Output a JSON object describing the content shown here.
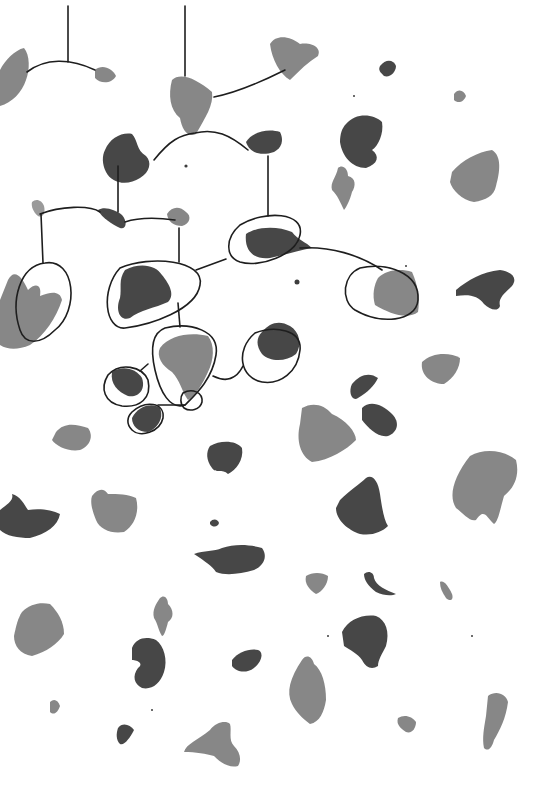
{
  "artwork": {
    "width": 551,
    "height": 789,
    "background": "#ffffff",
    "palette": {
      "dark": "#3d3d3d",
      "mid": "#7a7a7a",
      "light": "#8f8f8f",
      "wash": "#b5b5b5",
      "line": "#1e1e1e"
    },
    "wires": [
      "M68,6 L68,62",
      "M27,72 C45,58 70,58 95,70",
      "M185,6 L185,76",
      "M214,97 C240,92 265,80 285,70",
      "M154,160 C170,140 180,135 195,133 C215,128 230,135 248,150",
      "M118,166 L118,212",
      "M268,156 L268,216",
      "M40,214 C60,206 90,205 100,212",
      "M125,222 C140,217 160,218 175,220",
      "M41,214 L43,263",
      "M179,228 L179,262",
      "M178,303 L180,327",
      "M196,270 L226,259",
      "M300,248 C330,246 360,255 382,270",
      "M213,376 C225,382 236,380 243,366",
      "M140,371 L148,364",
      "M158,405 L185,405"
    ],
    "loops": [
      {
        "name": "loop-left-large",
        "d": "M45,263 C75,258 80,310 55,330 C40,345 25,345 20,330 C10,300 20,266 45,263 Z"
      },
      {
        "name": "loop-center",
        "d": "M120,268 C150,255 205,260 200,285 C196,310 150,325 125,328 C105,330 100,290 120,268 Z"
      },
      {
        "name": "loop-upper-right",
        "d": "M240,225 C265,210 305,212 300,235 C296,255 260,268 240,262 C225,257 225,238 240,225 Z"
      },
      {
        "name": "loop-right",
        "d": "M360,268 C385,262 420,272 418,300 C416,322 380,325 355,310 C340,300 343,275 360,268 Z"
      },
      {
        "name": "loop-mid-bottom",
        "d": "M165,328 C190,322 220,330 216,355 C212,380 195,395 185,405 C170,410 160,392 155,370 C150,348 152,333 165,328 Z"
      },
      {
        "name": "loop-mid-right",
        "d": "M255,333 C275,325 302,330 300,350 C298,372 280,385 262,382 C240,378 235,350 255,333 Z"
      },
      {
        "name": "loop-small-left",
        "d": "M108,375 C120,362 142,366 148,380 C152,398 140,408 122,406 C104,403 100,388 108,375 Z"
      },
      {
        "name": "loop-small-bottom",
        "d": "M132,412 C145,400 165,402 163,418 C160,432 140,438 132,430 C126,424 127,417 132,412 Z"
      },
      {
        "name": "loop-tiny-right",
        "d": "M183,393 C192,388 203,392 202,402 C200,410 190,412 184,408 C180,404 180,397 183,393 Z"
      }
    ],
    "blots": [
      {
        "name": "blot-top-left-edge",
        "tone": "mid",
        "d": "M0,70 C5,60 15,50 24,48 C30,55 30,70 26,80 C22,92 12,103 0,106 Z"
      },
      {
        "name": "blot-top-left-small",
        "tone": "mid",
        "d": "M95,70 C102,64 112,68 116,76 C112,84 100,84 95,78 Z"
      },
      {
        "name": "blot-top-center",
        "tone": "mid",
        "d": "M172,80 C180,72 196,78 212,92 C214,105 205,118 196,134 C188,138 182,130 180,118 C170,110 168,95 172,80 Z"
      },
      {
        "name": "blot-top-right-of-mobile",
        "tone": "mid",
        "d": "M270,44 C276,34 290,36 300,44 C312,42 322,48 318,56 C308,62 300,70 290,80 C280,74 272,60 270,44 Z"
      },
      {
        "name": "blot-dark-left-mobile",
        "tone": "dark",
        "d": "M105,150 C110,138 122,132 132,134 C138,140 136,150 146,156 C152,162 150,172 140,178 C128,186 112,184 106,172 C102,164 102,156 105,150 Z"
      },
      {
        "name": "blot-dark-right-mobile",
        "tone": "dark",
        "d": "M246,142 C252,132 268,128 280,132 C284,140 282,148 274,152 C262,156 250,154 246,142 Z"
      },
      {
        "name": "blot-tiny-upper-left",
        "tone": "light",
        "d": "M32,202 C36,198 42,200 44,206 C46,214 42,218 38,216 C33,212 31,206 32,202 Z"
      },
      {
        "name": "blot-dark-dash",
        "tone": "dark",
        "d": "M98,210 C105,206 115,210 122,215 C128,222 126,230 120,228 C112,224 102,218 98,210 Z"
      },
      {
        "name": "blot-small-center-top",
        "tone": "mid",
        "d": "M167,214 C172,206 180,206 186,212 C192,216 190,224 182,226 C174,226 168,222 167,214 Z"
      },
      {
        "name": "blot-left-large",
        "tone": "mid",
        "d": "M8,280 C14,268 22,276 28,290 C36,282 42,285 40,296 C50,292 60,290 62,300 C56,318 45,335 30,345 C18,350 8,350 0,345 L0,300 Z"
      },
      {
        "name": "blot-center-dark",
        "tone": "dark",
        "d": "M125,270 C140,262 156,265 162,275 C170,285 175,295 168,302 C155,308 140,310 130,318 C120,322 115,310 120,298 C122,288 118,280 125,270 Z"
      },
      {
        "name": "blot-upper-right-dark",
        "tone": "dark",
        "d": "M246,234 C258,226 278,226 292,232 C298,240 306,242 312,248 C300,250 285,255 270,258 C255,260 244,252 246,234 Z"
      },
      {
        "name": "blot-right-loop",
        "tone": "mid",
        "d": "M378,278 C386,270 400,268 412,272 C418,285 420,300 418,312 C408,320 390,314 375,305 C372,295 374,285 378,278 Z"
      },
      {
        "name": "blot-mid-bottom-loop",
        "tone": "mid",
        "d": "M160,348 C170,335 190,332 208,336 C215,345 214,360 208,372 C202,385 196,395 188,400 C182,392 180,380 172,372 C162,366 156,356 160,348 Z"
      },
      {
        "name": "blot-mid-right-loop",
        "tone": "dark",
        "d": "M262,332 C270,322 280,320 290,326 C300,332 302,345 296,354 C286,362 270,362 262,354 C256,346 256,338 262,332 Z"
      },
      {
        "name": "blot-small-left-loop",
        "tone": "dark",
        "d": "M112,372 C122,365 136,368 142,378 C146,390 138,398 128,396 C118,392 110,384 112,372 Z"
      },
      {
        "name": "blot-small-bottom-loop",
        "tone": "dark",
        "d": "M132,418 C138,406 152,402 160,408 C164,418 158,428 148,432 C138,432 132,426 132,418 Z"
      },
      {
        "name": "blot-dark-kidney-top-right",
        "tone": "dark",
        "d": "M346,124 C356,112 374,114 382,122 C384,134 378,146 372,150 C380,156 378,164 366,168 C352,168 342,156 340,142 C340,134 342,128 346,124 Z"
      },
      {
        "name": "blot-small-figure",
        "tone": "mid",
        "d": "M338,168 C342,164 348,168 348,176 C356,178 356,186 352,192 C350,200 346,208 344,210 C340,202 338,196 332,190 C330,182 336,178 338,168 Z"
      },
      {
        "name": "blot-top-right-dash",
        "tone": "dark",
        "d": "M380,66 C386,58 394,60 396,66 C396,72 390,78 384,76 C380,72 378,70 380,66 Z"
      },
      {
        "name": "blot-top-right-tiny",
        "tone": "mid",
        "d": "M454,94 C458,88 464,90 466,96 C464,102 458,104 454,100 Z"
      },
      {
        "name": "blot-right-large",
        "tone": "mid",
        "d": "M452,172 C462,160 478,152 492,150 C502,156 500,172 496,186 C494,196 486,200 474,202 C462,200 452,190 450,182 Z"
      },
      {
        "name": "blot-right-dark-bird",
        "tone": "dark",
        "d": "M456,290 C468,280 482,272 500,270 C512,272 518,278 512,286 C504,294 498,298 500,306 C498,312 490,310 484,304 C478,296 470,294 456,296 Z"
      },
      {
        "name": "blot-right-mid-small",
        "tone": "mid",
        "d": "M422,362 C432,352 450,352 460,358 C460,368 454,378 444,384 C432,384 420,376 422,362 Z"
      },
      {
        "name": "blot-left-small-mid",
        "tone": "mid",
        "d": "M56,432 C64,422 76,424 88,428 C94,436 90,446 80,450 C68,452 56,446 52,440 Z"
      },
      {
        "name": "blot-dark-dancers-1",
        "tone": "dark",
        "d": "M352,384 C360,374 370,372 378,378 C374,386 368,392 358,398 C352,402 348,392 352,384 Z"
      },
      {
        "name": "blot-dark-dancers-2",
        "tone": "dark",
        "d": "M362,408 C370,400 382,404 392,414 C400,422 398,432 388,436 C378,438 368,428 362,420 Z"
      },
      {
        "name": "blot-center-square",
        "tone": "mid",
        "d": "M302,408 C312,402 324,404 332,414 C346,420 356,432 356,440 C346,450 330,460 312,462 C300,456 296,440 300,424 Z"
      },
      {
        "name": "blot-dark-center-mid",
        "tone": "dark",
        "d": "M210,446 C220,440 236,440 242,448 C244,460 236,470 228,474 C222,468 216,474 212,468 C206,460 206,452 210,446 Z"
      },
      {
        "name": "blot-right-jelly",
        "tone": "mid",
        "d": "M470,456 C484,448 504,450 516,460 C520,476 514,488 504,496 C500,510 498,522 494,524 C486,516 484,508 476,520 C470,522 464,514 456,508 C448,496 454,476 470,456 Z"
      },
      {
        "name": "blot-left-dark-bird",
        "tone": "dark",
        "d": "M0,510 C8,504 14,500 12,494 C20,496 24,504 28,510 C40,508 52,510 60,514 C58,526 46,534 30,538 C18,538 6,536 0,530 Z"
      },
      {
        "name": "blot-left-center-square",
        "tone": "mid",
        "d": "M92,496 C98,488 104,488 108,494 C118,494 128,494 136,498 C140,512 134,526 124,532 C112,534 100,530 96,520 C92,510 90,502 92,496 Z"
      },
      {
        "name": "blot-dark-center-right",
        "tone": "dark",
        "d": "M340,500 C350,490 360,484 366,478 C372,474 378,480 380,494 C382,508 384,520 388,526 C382,532 372,536 360,534 C348,530 336,520 336,508 Z"
      },
      {
        "name": "blot-dark-bird-lower",
        "tone": "dark",
        "d": "M194,554 C204,550 214,552 222,548 C234,544 248,544 262,548 C268,556 264,566 254,570 C240,574 226,576 216,572 C212,566 206,562 194,554 Z"
      },
      {
        "name": "blot-dot-center",
        "tone": "dark",
        "d": "M210,522 C213,518 218,519 219,523 C218,527 213,528 210,524 Z"
      },
      {
        "name": "blot-right-small-1",
        "tone": "mid",
        "d": "M306,576 C312,572 322,572 328,576 C328,584 322,592 316,594 C310,590 304,584 306,576 Z"
      },
      {
        "name": "blot-right-hook",
        "tone": "dark",
        "d": "M364,574 C368,570 374,572 374,578 C376,586 386,590 396,594 C392,596 384,596 376,592 C368,586 364,580 364,574 Z"
      },
      {
        "name": "blot-right-tiny-2",
        "tone": "mid",
        "d": "M440,582 C444,580 448,586 452,594 C454,600 450,602 446,598 C442,592 440,588 440,582 Z"
      },
      {
        "name": "blot-lower-left-large",
        "tone": "mid",
        "d": "M22,612 C30,604 40,602 50,604 C58,612 64,622 64,634 C58,644 46,652 32,656 C20,654 14,646 14,636 C16,626 18,618 22,612 Z"
      },
      {
        "name": "blot-lower-small-figure",
        "tone": "mid",
        "d": "M160,598 C164,594 168,598 168,604 C174,610 174,618 168,622 C166,630 164,636 162,636 C158,630 158,624 154,618 C152,610 156,604 160,598 Z"
      },
      {
        "name": "blot-lower-dark-kidney",
        "tone": "dark",
        "d": "M132,648 C136,638 146,636 156,640 C164,646 168,660 164,672 C160,684 152,690 142,688 C134,684 132,676 138,668 C144,664 138,660 132,660 Z"
      },
      {
        "name": "blot-lower-dark-center",
        "tone": "dark",
        "d": "M232,660 C238,652 250,648 258,650 C264,652 262,662 254,668 C246,674 236,672 232,666 Z"
      },
      {
        "name": "blot-lower-dark-right",
        "tone": "dark",
        "d": "M342,632 C348,620 362,614 376,616 C386,620 390,632 386,646 C382,654 378,660 378,666 C372,670 366,668 362,660 C358,654 350,650 344,646 Z"
      },
      {
        "name": "blot-lower-center-tall",
        "tone": "mid",
        "d": "M302,660 C306,654 312,656 314,664 C322,670 326,684 326,700 C324,712 320,722 310,724 C302,718 296,712 292,704 C286,692 290,678 302,660 Z"
      },
      {
        "name": "blot-lower-right-leaf",
        "tone": "mid",
        "d": "M488,696 C496,690 506,694 508,702 C506,718 500,730 494,740 C492,748 488,752 484,748 C482,738 484,728 486,716 Z"
      },
      {
        "name": "blot-lower-tiny-left",
        "tone": "mid",
        "d": "M50,702 C54,698 58,700 60,706 C58,712 54,716 50,712 Z"
      },
      {
        "name": "blot-lower-dark-small",
        "tone": "dark",
        "d": "M118,728 C122,722 130,724 134,730 C130,738 124,746 120,744 C116,740 116,734 118,728 Z"
      },
      {
        "name": "blot-lower-butterfly",
        "tone": "mid",
        "d": "M210,730 C216,722 226,720 230,724 C232,730 228,740 234,746 C240,752 242,760 238,766 C230,768 222,764 214,756 C206,754 196,752 184,752 C186,744 198,740 210,730 Z"
      },
      {
        "name": "blot-lower-right-small",
        "tone": "mid",
        "d": "M398,718 C404,714 412,716 416,722 C416,728 412,734 406,732 C400,728 396,724 398,718 Z"
      }
    ],
    "dots": [
      {
        "cx": 186,
        "cy": 166,
        "r": 1.6
      },
      {
        "cx": 297,
        "cy": 282,
        "r": 2.5
      },
      {
        "cx": 354,
        "cy": 96,
        "r": 1
      },
      {
        "cx": 406,
        "cy": 266,
        "r": 1
      },
      {
        "cx": 328,
        "cy": 636,
        "r": 1
      },
      {
        "cx": 472,
        "cy": 636,
        "r": 1
      },
      {
        "cx": 152,
        "cy": 710,
        "r": 1
      }
    ]
  }
}
